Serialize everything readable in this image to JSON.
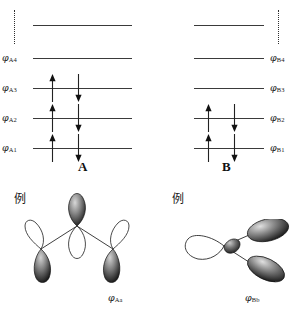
{
  "figure": {
    "type": "molecular-orbital-energy-level-diagram",
    "panels": [
      {
        "id": "A",
        "title": "A",
        "continuation_marker": "vertical-dotted-line",
        "continuation_side": "left",
        "label_side": "left",
        "levels": [
          {
            "label": "",
            "label_phi": "",
            "label_sub": "",
            "electrons": 0,
            "unlabeled": true
          },
          {
            "label": "phi_A4",
            "label_phi": "φ",
            "label_sub": "A4",
            "electrons": 0,
            "unlabeled": false
          },
          {
            "label": "phi_A3",
            "label_phi": "φ",
            "label_sub": "A3",
            "electrons": 2,
            "unlabeled": false
          },
          {
            "label": "phi_A2",
            "label_phi": "φ",
            "label_sub": "A2",
            "electrons": 2,
            "unlabeled": false
          },
          {
            "label": "phi_A1",
            "label_phi": "φ",
            "label_sub": "A1",
            "electrons": 2,
            "unlabeled": false
          }
        ]
      },
      {
        "id": "B",
        "title": "B",
        "continuation_marker": "vertical-dotted-line",
        "continuation_side": "right",
        "label_side": "right",
        "levels": [
          {
            "label": "",
            "label_phi": "",
            "label_sub": "",
            "electrons": 0,
            "unlabeled": true
          },
          {
            "label": "phi_B4",
            "label_phi": "φ",
            "label_sub": "B4",
            "electrons": 0,
            "unlabeled": false
          },
          {
            "label": "phi_B3",
            "label_phi": "φ",
            "label_sub": "B3",
            "electrons": 0,
            "unlabeled": false
          },
          {
            "label": "phi_B2",
            "label_phi": "φ",
            "label_sub": "B2",
            "electrons": 2,
            "unlabeled": false
          },
          {
            "label": "phi_B1",
            "label_phi": "φ",
            "label_sub": "B1",
            "electrons": 2,
            "unlabeled": false
          }
        ]
      }
    ],
    "electron_arrows": {
      "up_label": "spin-up-electron",
      "down_label": "spin-down-electron"
    },
    "orbitals": [
      {
        "id": "Aa",
        "example_label": "例",
        "caption_phi": "φ",
        "caption_sub": "Aa",
        "description": "three-lobe trigonal p-orbital set"
      },
      {
        "id": "Bb",
        "example_label": "例",
        "caption_phi": "φ",
        "caption_sub": "Bb",
        "description": "three-lobe bent p-orbital set"
      }
    ]
  },
  "colors": {
    "line": "#3a3a3a",
    "text": "#1a1a1a",
    "lobe_dark": "#1c1c1c",
    "lobe_light": "#ffffff",
    "background": "#ffffff"
  }
}
